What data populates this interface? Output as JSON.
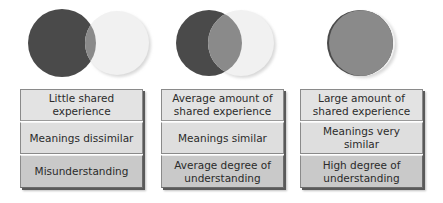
{
  "colors": {
    "dark_circle": "#4a4a4a",
    "light_circle": "#f1f1f1",
    "overlap": "#888888",
    "row_light": "#e3e3e3",
    "row_bottom": "#c9c9c9",
    "text": "#2b2b2b"
  },
  "diagrams": [
    {
      "overlap": "small",
      "rows": [
        {
          "text": "Little shared experience"
        },
        {
          "text": "Meanings dissimilar"
        },
        {
          "text": "Misunderstanding"
        }
      ]
    },
    {
      "overlap": "medium",
      "rows": [
        {
          "text": "Average amount of shared experience"
        },
        {
          "text": "Meanings similar"
        },
        {
          "text": "Average degree of understanding"
        }
      ]
    },
    {
      "overlap": "large",
      "rows": [
        {
          "text": "Large amount of shared experience"
        },
        {
          "text": "Meanings very similar"
        },
        {
          "text": "High degree of understanding"
        }
      ]
    }
  ]
}
